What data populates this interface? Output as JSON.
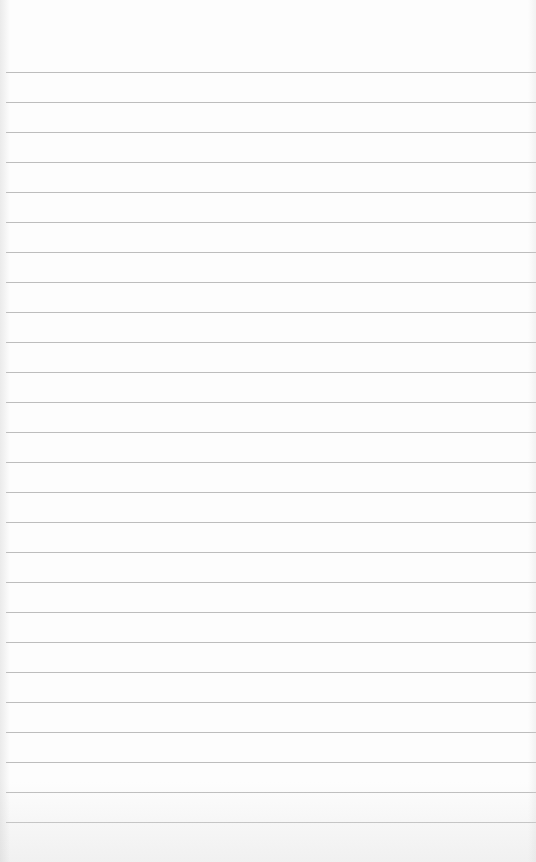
{
  "paper": {
    "type": "lined-paper",
    "background_color": "#fdfdfd",
    "line_color": "#bdbdbd",
    "first_line_y": 72,
    "line_spacing": 30,
    "line_count": 26
  }
}
